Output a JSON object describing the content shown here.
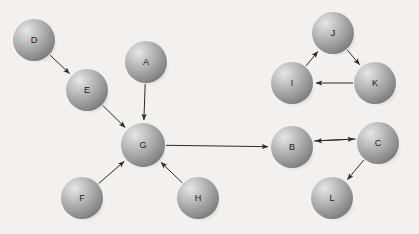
{
  "diagram": {
    "type": "node-link-diagram",
    "background_color": "#f2f1ef",
    "node_fill_color": "#9e9e9e",
    "node_highlight_color": "#dedede",
    "node_shadow_color": "#6f6f6f",
    "edge_color": "#2b2b2b",
    "label_color": "#1a1a1a",
    "node_radius": 21,
    "nodes": [
      {
        "id": "D",
        "label": "D",
        "cx": 34,
        "cy": 40,
        "r": 21
      },
      {
        "id": "A",
        "label": "A",
        "cx": 146,
        "cy": 62,
        "r": 21
      },
      {
        "id": "E",
        "label": "E",
        "cx": 87,
        "cy": 90,
        "r": 21
      },
      {
        "id": "G",
        "label": "G",
        "cx": 143,
        "cy": 145,
        "r": 22
      },
      {
        "id": "F",
        "label": "F",
        "cx": 82,
        "cy": 198,
        "r": 21
      },
      {
        "id": "H",
        "label": "H",
        "cx": 198,
        "cy": 198,
        "r": 21
      },
      {
        "id": "J",
        "label": "J",
        "cx": 333,
        "cy": 33,
        "r": 21
      },
      {
        "id": "I",
        "label": "I",
        "cx": 292,
        "cy": 83,
        "r": 21
      },
      {
        "id": "K",
        "label": "K",
        "cx": 375,
        "cy": 83,
        "r": 21
      },
      {
        "id": "B",
        "label": "B",
        "cx": 292,
        "cy": 147,
        "r": 21
      },
      {
        "id": "C",
        "label": "C",
        "cx": 378,
        "cy": 143,
        "r": 21
      },
      {
        "id": "L",
        "label": "L",
        "cx": 332,
        "cy": 198,
        "r": 21
      }
    ],
    "edges": [
      {
        "from": "D",
        "to": "E",
        "directed": true,
        "offset": 0
      },
      {
        "from": "E",
        "to": "G",
        "directed": true,
        "offset": 0
      },
      {
        "from": "A",
        "to": "G",
        "directed": true,
        "offset": 0
      },
      {
        "from": "F",
        "to": "G",
        "directed": true,
        "offset": 0
      },
      {
        "from": "H",
        "to": "G",
        "directed": true,
        "offset": 0
      },
      {
        "from": "G",
        "to": "B",
        "directed": true,
        "offset": 0
      },
      {
        "from": "I",
        "to": "J",
        "directed": true,
        "offset": 0
      },
      {
        "from": "J",
        "to": "K",
        "directed": true,
        "offset": 0
      },
      {
        "from": "K",
        "to": "I",
        "directed": true,
        "offset": 0
      },
      {
        "from": "B",
        "to": "C",
        "directed": true,
        "offset": -5
      },
      {
        "from": "C",
        "to": "B",
        "directed": true,
        "offset": 5
      },
      {
        "from": "C",
        "to": "L",
        "directed": true,
        "offset": 0
      }
    ]
  }
}
